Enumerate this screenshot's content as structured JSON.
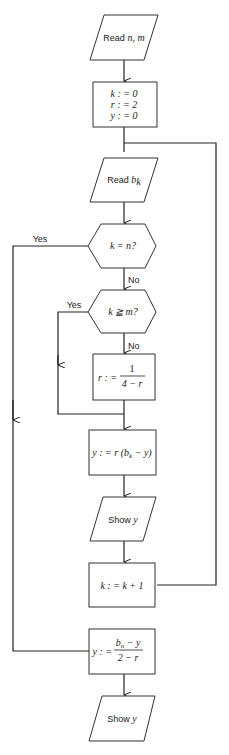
{
  "diagram": {
    "type": "flowchart",
    "nodes": {
      "read_nm": {
        "shape": "parallelogram",
        "label_prefix": "Read ",
        "label_var": "n, m"
      },
      "init": {
        "shape": "rectangle",
        "lines": [
          "k : = 0",
          "r : = 2",
          "y : = 0"
        ]
      },
      "read_bk": {
        "shape": "parallelogram",
        "label_prefix": "Read ",
        "label_var": "b",
        "label_sub": "k"
      },
      "dec_kn": {
        "shape": "hexagon",
        "label": "k = n?"
      },
      "dec_km": {
        "shape": "hexagon",
        "label": "k ≧ m?"
      },
      "assign_r": {
        "shape": "rectangle",
        "lhs": "r : =",
        "num": "1",
        "den": "4 − r"
      },
      "assign_y": {
        "shape": "rectangle",
        "label": "y : = r (b",
        "sub": "k",
        "tail": " − y)"
      },
      "show_y1": {
        "shape": "parallelogram",
        "label_prefix": "Show ",
        "label_var": "y"
      },
      "incr_k": {
        "shape": "rectangle",
        "label": "k : = k + 1"
      },
      "final_y": {
        "shape": "rectangle",
        "lhs": "y : =",
        "num_pre": "b",
        "num_sub": "n",
        "num_tail": " − y",
        "den": "2 − r"
      },
      "show_y2": {
        "shape": "parallelogram",
        "label_prefix": "Show ",
        "label_var": "y"
      }
    },
    "edge_labels": {
      "kn_yes": "Yes",
      "kn_no": "No",
      "km_yes": "Yes",
      "km_no": "No"
    },
    "edges": [
      {
        "from": "read_nm",
        "to": "init"
      },
      {
        "from": "init",
        "to": "read_bk"
      },
      {
        "from": "read_bk",
        "to": "dec_kn"
      },
      {
        "from": "dec_kn",
        "to": "dec_km",
        "label": "No"
      },
      {
        "from": "dec_kn",
        "to": "final_y",
        "label": "Yes"
      },
      {
        "from": "dec_km",
        "to": "assign_r",
        "label": "No"
      },
      {
        "from": "dec_km",
        "to": "assign_y",
        "label": "Yes"
      },
      {
        "from": "assign_r",
        "to": "assign_y"
      },
      {
        "from": "assign_y",
        "to": "show_y1"
      },
      {
        "from": "show_y1",
        "to": "incr_k"
      },
      {
        "from": "incr_k",
        "to": "read_bk"
      },
      {
        "from": "final_y",
        "to": "show_y2"
      }
    ]
  }
}
